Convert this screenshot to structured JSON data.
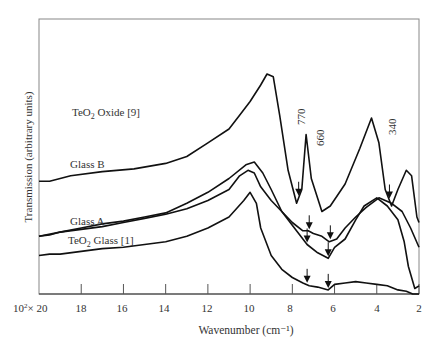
{
  "chart_data": {
    "type": "line",
    "title": "",
    "xlabel": "Wavenumber (cm⁻¹)",
    "ylabel": "Transmission (arbitrary units)",
    "x_unit_prefix": "10²×",
    "xlim": [
      20,
      2
    ],
    "x_reversed": true,
    "x_ticks": [
      20,
      18,
      16,
      14,
      12,
      10,
      8,
      6,
      4,
      2
    ],
    "x_tick_labels": [
      "10²× 20",
      "18",
      "16",
      "14",
      "12",
      "10",
      "8",
      "6",
      "4",
      "2"
    ],
    "grid": false,
    "legend": "inline labels",
    "series": [
      {
        "name": "TeO₂ Oxide [9]",
        "label_pos": [
          73,
          133
        ],
        "points": [
          [
            20,
            0.59
          ],
          [
            19.5,
            0.59
          ],
          [
            18.5,
            0.57
          ],
          [
            17,
            0.555
          ],
          [
            15.5,
            0.545
          ],
          [
            14,
            0.525
          ],
          [
            13,
            0.5
          ],
          [
            12,
            0.45
          ],
          [
            11,
            0.4
          ],
          [
            10.5,
            0.35
          ],
          [
            10,
            0.3
          ],
          [
            9.5,
            0.24
          ],
          [
            9.2,
            0.2
          ],
          [
            8.9,
            0.21
          ],
          [
            8.6,
            0.35
          ],
          [
            8.2,
            0.55
          ],
          [
            7.8,
            0.67
          ],
          [
            7.55,
            0.62
          ],
          [
            7.35,
            0.42
          ],
          [
            7.1,
            0.58
          ],
          [
            6.6,
            0.7
          ],
          [
            6.2,
            0.68
          ],
          [
            5.5,
            0.6
          ],
          [
            4.8,
            0.47
          ],
          [
            4.25,
            0.36
          ],
          [
            3.9,
            0.45
          ],
          [
            3.6,
            0.62
          ],
          [
            3.3,
            0.68
          ],
          [
            3.0,
            0.62
          ],
          [
            2.6,
            0.55
          ],
          [
            2.35,
            0.57
          ],
          [
            2.1,
            0.72
          ],
          [
            2.0,
            0.74
          ]
        ],
        "arrows_at": [
          7.7,
          3.4
        ]
      },
      {
        "name": "Glass B",
        "label_pos": [
          93,
          190
        ],
        "points": [
          [
            20,
            0.79
          ],
          [
            19.5,
            0.785
          ],
          [
            19,
            0.775
          ],
          [
            18,
            0.765
          ],
          [
            17,
            0.755
          ],
          [
            16,
            0.74
          ],
          [
            15,
            0.725
          ],
          [
            14,
            0.71
          ],
          [
            13,
            0.69
          ],
          [
            12,
            0.66
          ],
          [
            11,
            0.62
          ],
          [
            10.5,
            0.57
          ],
          [
            10.1,
            0.55
          ],
          [
            9.8,
            0.56
          ],
          [
            9.5,
            0.61
          ],
          [
            9.0,
            0.66
          ],
          [
            8.5,
            0.7
          ],
          [
            8.0,
            0.74
          ],
          [
            7.5,
            0.77
          ],
          [
            7.25,
            0.77
          ],
          [
            7.0,
            0.78
          ],
          [
            6.6,
            0.79
          ],
          [
            6.25,
            0.81
          ],
          [
            5.9,
            0.8
          ],
          [
            5.5,
            0.76
          ],
          [
            5.0,
            0.72
          ],
          [
            4.5,
            0.685
          ],
          [
            3.9,
            0.65
          ],
          [
            3.3,
            0.67
          ],
          [
            2.8,
            0.7
          ],
          [
            2.4,
            0.76
          ],
          [
            2.0,
            0.83
          ]
        ],
        "arrows_at": [
          7.2,
          6.2
        ]
      },
      {
        "name": "Glass A",
        "label_pos": [
          93,
          247
        ],
        "points": [
          [
            20,
            0.79
          ],
          [
            19,
            0.775
          ],
          [
            18,
            0.76
          ],
          [
            17,
            0.745
          ],
          [
            16,
            0.735
          ],
          [
            15,
            0.72
          ],
          [
            14,
            0.705
          ],
          [
            13,
            0.67
          ],
          [
            12,
            0.63
          ],
          [
            11,
            0.58
          ],
          [
            10.2,
            0.53
          ],
          [
            9.8,
            0.52
          ],
          [
            9.4,
            0.56
          ],
          [
            9.0,
            0.62
          ],
          [
            8.5,
            0.7
          ],
          [
            8.0,
            0.75
          ],
          [
            7.3,
            0.82
          ],
          [
            6.8,
            0.85
          ],
          [
            6.3,
            0.87
          ],
          [
            6.0,
            0.83
          ],
          [
            5.5,
            0.8
          ],
          [
            5.0,
            0.73
          ],
          [
            4.6,
            0.68
          ],
          [
            4.0,
            0.65
          ],
          [
            3.5,
            0.68
          ],
          [
            3.0,
            0.73
          ],
          [
            2.7,
            0.81
          ],
          [
            2.5,
            0.9
          ],
          [
            2.2,
            0.98
          ],
          [
            2.0,
            0.97
          ]
        ],
        "arrows_at": [
          7.3,
          6.3
        ]
      },
      {
        "name": "TeO₂ Glass [1]",
        "label_pos": [
          80,
          268
        ],
        "points": [
          [
            20,
            0.86
          ],
          [
            19.5,
            0.855
          ],
          [
            19,
            0.855
          ],
          [
            18,
            0.845
          ],
          [
            17,
            0.835
          ],
          [
            16,
            0.83
          ],
          [
            15,
            0.82
          ],
          [
            14,
            0.81
          ],
          [
            13,
            0.79
          ],
          [
            12,
            0.76
          ],
          [
            11,
            0.72
          ],
          [
            10.3,
            0.66
          ],
          [
            10.0,
            0.63
          ],
          [
            9.7,
            0.67
          ],
          [
            9.5,
            0.76
          ],
          [
            9.0,
            0.86
          ],
          [
            8.5,
            0.91
          ],
          [
            8.0,
            0.94
          ],
          [
            7.5,
            0.96
          ],
          [
            7.2,
            0.97
          ],
          [
            6.8,
            0.975
          ],
          [
            6.3,
            0.985
          ],
          [
            6.0,
            0.965
          ],
          [
            5.5,
            0.96
          ],
          [
            5.0,
            0.955
          ],
          [
            4.5,
            0.96
          ],
          [
            4.0,
            0.965
          ],
          [
            3.5,
            0.97
          ],
          [
            3.0,
            0.985
          ],
          [
            2.6,
            0.99
          ],
          [
            2.3,
            1.0
          ],
          [
            2.0,
            1.0
          ]
        ],
        "arrows_at": [
          7.3,
          6.3
        ]
      }
    ],
    "annotations": [
      {
        "text": "770",
        "x": 7.7,
        "rotated": true
      },
      {
        "text": "660",
        "x": 6.6,
        "rotated": true
      },
      {
        "text": "340",
        "x": 3.4,
        "rotated": true
      }
    ]
  },
  "labels": {
    "ylabel": "Transmission (arbitrary units)",
    "xlabel": "Wavenumber (cm⁻¹)",
    "first_tick_prefix": "10",
    "first_tick_sup": "2",
    "first_tick_rest": "× 20",
    "ticks": [
      "18",
      "16",
      "14",
      "12",
      "10",
      "8",
      "6",
      "4",
      "2"
    ],
    "series_oxide_main": "TeO",
    "series_oxide_sub": "2",
    "series_oxide_rest": " Oxide [9]",
    "series_glassb": "Glass B",
    "series_glassa": "Glass A",
    "series_teo2glass_main": "TeO",
    "series_teo2glass_sub": "2",
    "series_teo2glass_rest": " Glass [1]",
    "annot_770": "770",
    "annot_660": "660",
    "annot_340": "340"
  }
}
